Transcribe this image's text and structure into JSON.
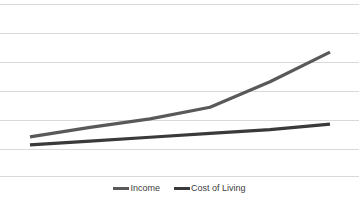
{
  "chart_data": {
    "type": "line",
    "title": "",
    "subtitle": "",
    "xlabel": "",
    "ylabel": "",
    "grid": true,
    "gridlines_count": 6,
    "legend_position": "bottom-center",
    "xlim": [
      0,
      5
    ],
    "ylim": [
      0,
      6
    ],
    "x": [
      0,
      1,
      2,
      3,
      4,
      5
    ],
    "series": [
      {
        "name": "Income",
        "color": "#595959",
        "values": [
          1.0,
          1.45,
          1.85,
          2.4,
          3.6,
          5.0
        ],
        "shape": "exponential-rising"
      },
      {
        "name": "Cost of Living",
        "color": "#3a3a3a",
        "values": [
          0.62,
          0.8,
          0.98,
          1.16,
          1.34,
          1.6
        ],
        "shape": "linear-rising"
      }
    ],
    "xtick_labels": [],
    "ytick_labels": [],
    "annotations": []
  },
  "legend": {
    "entries": [
      {
        "label": "Income",
        "marker": "line-swatch-icon",
        "color": "#595959"
      },
      {
        "label": "Cost of Living",
        "marker": "line-swatch-icon",
        "color": "#3a3a3a"
      }
    ]
  },
  "colors": {
    "background": "#ffffff",
    "gridline": "#d9d9d9",
    "axis": "#d9d9d9",
    "income": "#595959",
    "cost_of_living": "#3a3a3a",
    "legend_text": "#404040"
  }
}
